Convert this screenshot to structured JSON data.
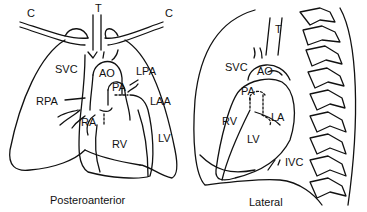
{
  "posteroanterior": {
    "caption": "Posteroanterior",
    "labels": {
      "c_left": "C",
      "t": "T",
      "c_right": "C",
      "svc": "SVC",
      "ao": "AO",
      "lpa": "LPA",
      "pa": "PA",
      "rpa": "RPA",
      "laa": "LAA",
      "ra": "RA",
      "rv": "RV",
      "lv": "LV"
    }
  },
  "lateral": {
    "caption": "Lateral",
    "labels": {
      "t": "T",
      "svc": "SVC",
      "ao": "AO",
      "pa": "PA",
      "rv": "RV",
      "la": "LA",
      "lv": "LV",
      "ivc": "IVC"
    }
  },
  "colors": {
    "stroke": "#111111",
    "background": "#ffffff"
  }
}
